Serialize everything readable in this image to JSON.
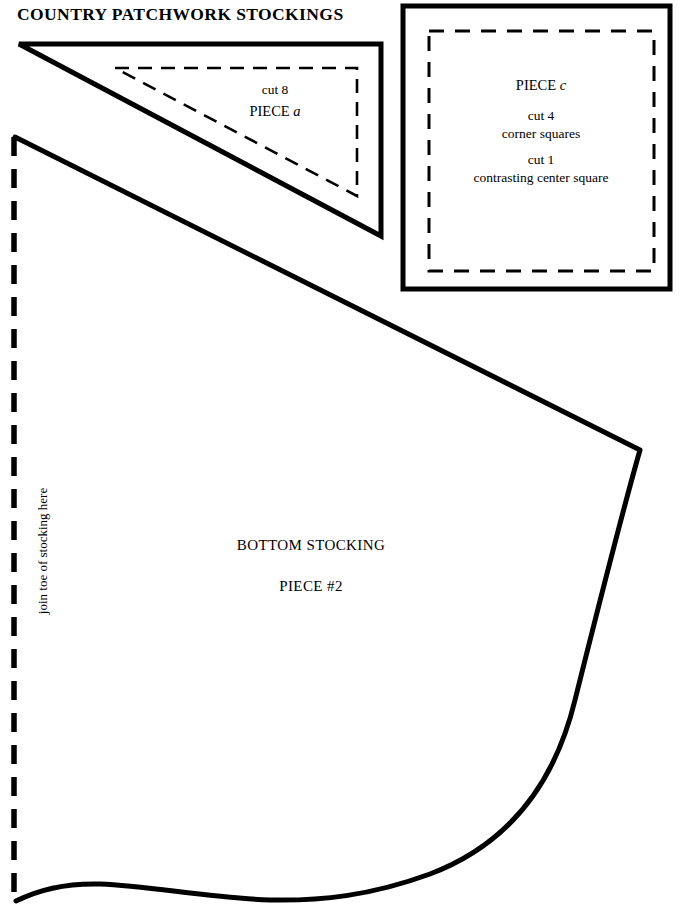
{
  "sheet": {
    "title": "COUNTRY PATCHWORK STOCKINGS",
    "background_color": "#ffffff",
    "ink_color": "#000000",
    "width": 687,
    "height": 917
  },
  "pieces": {
    "piece_a": {
      "shape": "right-triangle",
      "cut_instruction": "cut 8",
      "name_prefix": "PIECE ",
      "name_letter": "a",
      "outline_style": "solid",
      "inner_line_style": "dashed",
      "inner_line_meaning": "seam line"
    },
    "piece_c": {
      "shape": "square",
      "name_prefix": "PIECE ",
      "name_letter": "c",
      "cut_instruction_1": "cut 4",
      "cut_description_1": "corner squares",
      "cut_instruction_2": "cut 1",
      "cut_description_2": "contrasting center square",
      "outline_style": "solid",
      "inner_line_style": "dashed",
      "inner_line_meaning": "seam line"
    },
    "piece_2": {
      "shape": "stocking-bottom",
      "name": "BOTTOM STOCKING",
      "number_label": "PIECE #2",
      "fold_edge_note": "join toe of stocking here",
      "fold_edge_style": "dashed",
      "outline_style": "solid"
    }
  },
  "icons": {
    "dashed_line": "dashed-seam-line-icon",
    "solid_line": "solid-cut-line-icon"
  }
}
